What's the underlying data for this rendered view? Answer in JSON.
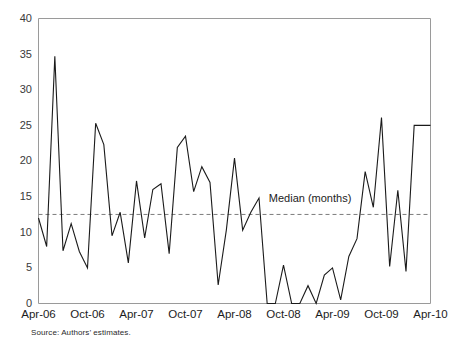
{
  "chart_data": {
    "type": "line",
    "title": "",
    "xlabel": "",
    "ylabel": "",
    "ylim": [
      0,
      40
    ],
    "yticks": [
      0,
      5,
      10,
      15,
      20,
      25,
      30,
      35,
      40
    ],
    "grid": false,
    "legend_position": "inline-annotation",
    "x_tick_labels": [
      "Apr-06",
      "Oct-06",
      "Apr-07",
      "Oct-07",
      "Apr-08",
      "Oct-08",
      "Apr-09",
      "Oct-09",
      "Apr-10"
    ],
    "x_tick_indices": [
      0,
      6,
      12,
      18,
      24,
      30,
      36,
      42,
      48
    ],
    "x": [
      "Apr-06",
      "May-06",
      "Jun-06",
      "Jul-06",
      "Aug-06",
      "Sep-06",
      "Oct-06",
      "Nov-06",
      "Dec-06",
      "Jan-07",
      "Feb-07",
      "Mar-07",
      "Apr-07",
      "May-07",
      "Jun-07",
      "Jul-07",
      "Aug-07",
      "Sep-07",
      "Oct-07",
      "Nov-07",
      "Dec-07",
      "Jan-08",
      "Feb-08",
      "Mar-08",
      "Apr-08",
      "May-08",
      "Jun-08",
      "Jul-08",
      "Aug-08",
      "Sep-08",
      "Oct-08",
      "Nov-08",
      "Dec-08",
      "Jan-09",
      "Feb-09",
      "Mar-09",
      "Apr-09",
      "May-09",
      "Jun-09",
      "Jul-09",
      "Aug-09",
      "Sep-09",
      "Oct-09",
      "Nov-09",
      "Dec-09",
      "Jan-10",
      "Feb-10",
      "Mar-10",
      "Apr-10"
    ],
    "series": [
      {
        "name": "Time to completion (months)",
        "values": [
          12.0,
          8.0,
          34.7,
          7.4,
          11.2,
          7.3,
          5.0,
          25.3,
          22.3,
          9.5,
          12.8,
          5.7,
          17.2,
          9.2,
          16.0,
          16.8,
          7.0,
          21.9,
          23.5,
          15.7,
          19.2,
          17.0,
          2.6,
          10.3,
          20.4,
          10.3,
          12.8,
          14.8,
          0.0,
          0.0,
          5.4,
          0.0,
          0.0,
          2.5,
          0.0,
          4.0,
          5.0,
          0.5,
          6.6,
          9.1,
          18.5,
          13.5,
          26.1,
          5.2,
          15.9,
          4.5,
          25.0,
          25.0,
          25.0
        ]
      }
    ],
    "annotations": [
      {
        "name": "median-line",
        "label": "Median (months)",
        "type": "horizontal-reference-line",
        "value": 12.5,
        "style": "dashed",
        "label_x_index": 28.2,
        "label_y": 14.2
      }
    ]
  },
  "footnote": {
    "source": "Source: Authors’ estimates."
  },
  "colors": {
    "series": "#1a1a1a",
    "median": "#7d7d7d",
    "axis": "#9a9a9a",
    "text": "#1c1c1c",
    "background": "#ffffff"
  }
}
